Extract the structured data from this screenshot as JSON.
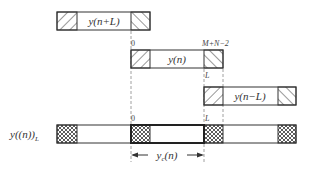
{
  "diagram": {
    "colors": {
      "stroke": "#333333",
      "dash": "#888888",
      "background": "#ffffff"
    },
    "sequences": [
      {
        "id": "shift-plus",
        "label": "y(n+L)",
        "left_hatch": "backslash",
        "right_hatch": "slash"
      },
      {
        "id": "original",
        "label": "y(n)",
        "left_hatch": "backslash",
        "right_hatch": "slash"
      },
      {
        "id": "shift-minus",
        "label": "y(n−L)",
        "left_hatch": "backslash",
        "right_hatch": "slash"
      }
    ],
    "tick_labels": {
      "zero_top": "0",
      "end_top": "M+N−2",
      "L_mid": "L",
      "zero_bottom": "0",
      "L_bottom": "L"
    },
    "result": {
      "label_main": "y((n))",
      "label_sub": "L",
      "hatch": "crosshatch"
    },
    "span_arrow": {
      "label_main": "y",
      "label_sub": "c",
      "label_tail": "(n)"
    }
  }
}
